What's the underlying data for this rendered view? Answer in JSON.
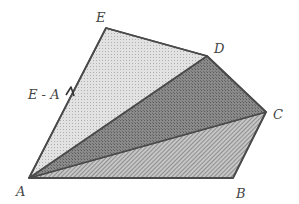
{
  "diagram": {
    "vertices": {
      "A": {
        "label": "A",
        "x": 29,
        "y": 178,
        "label_x": 16,
        "label_y": 196
      },
      "B": {
        "label": "B",
        "x": 233,
        "y": 178,
        "label_x": 236,
        "label_y": 198
      },
      "C": {
        "label": "C",
        "x": 266,
        "y": 112,
        "label_x": 273,
        "label_y": 119
      },
      "D": {
        "label": "D",
        "x": 207,
        "y": 56,
        "label_x": 214,
        "label_y": 53
      },
      "E": {
        "label": "E",
        "x": 106,
        "y": 28,
        "label_x": 96,
        "label_y": 22
      }
    },
    "triangles": [
      {
        "name": "ABC",
        "fill": "#b8b8b8"
      },
      {
        "name": "ACD",
        "fill": "#7c7c7c"
      },
      {
        "name": "ADE",
        "fill": "#d9d9d9"
      }
    ],
    "edge_label": {
      "text": "E - A",
      "x": 28,
      "y": 99
    },
    "stroke_color": "#4a4a4a"
  }
}
